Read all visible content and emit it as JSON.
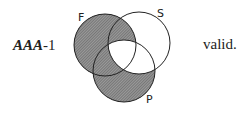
{
  "syllogism": {
    "mood": "AAA",
    "figure": "-1",
    "verdict": "valid."
  },
  "diagram": {
    "circles": [
      {
        "label": "F",
        "cx": 105,
        "cy": 45,
        "r": 31
      },
      {
        "label": "S",
        "cx": 139,
        "cy": 43,
        "r": 31
      },
      {
        "label": "P",
        "cx": 124,
        "cy": 71,
        "r": 31
      }
    ],
    "shaded_regions": [
      "F only",
      "F∩S not P",
      "F∩P not S",
      "P only"
    ],
    "unshaded_regions": [
      "S only",
      "S∩P not F",
      "F∩S∩P"
    ],
    "colors": {
      "stroke": "#222222",
      "shade": "#7a7a7a"
    }
  }
}
